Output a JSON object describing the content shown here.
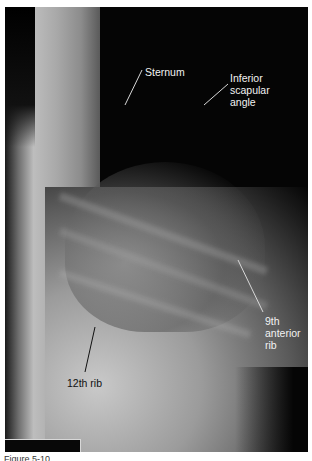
{
  "image": {
    "subject": "lateral radiograph of the thoracolumbar region",
    "labels": {
      "sternum": "Sternum",
      "inferior_scapular_angle": [
        "Inferior",
        "scapular",
        "angle"
      ],
      "ninth_anterior_rib": [
        "9th",
        "anterior",
        "rib"
      ],
      "twelfth_rib": "12th rib"
    },
    "caption": "Figure 5-10"
  }
}
